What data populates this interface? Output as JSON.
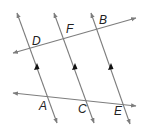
{
  "diagram": {
    "type": "geometry-parallel-lines",
    "colors": {
      "line": "#7d7d7d",
      "label": "#222222",
      "arrow": "#111111",
      "background": "#ffffff"
    },
    "transversals": [
      {
        "name": "top-line",
        "from": [
          13,
          53
        ],
        "to": [
          136,
          18
        ],
        "points": [
          "D",
          "F",
          "B"
        ]
      },
      {
        "name": "bottom-line",
        "from": [
          13,
          93
        ],
        "to": [
          136,
          106
        ],
        "points": [
          "A",
          "C",
          "E"
        ]
      }
    ],
    "parallel_lines": [
      {
        "name": "line-DA",
        "from": [
          17,
          13
        ],
        "to": [
          57,
          123
        ],
        "points": [
          "D",
          "A"
        ]
      },
      {
        "name": "line-FC",
        "from": [
          54,
          13
        ],
        "to": [
          94,
          123
        ],
        "points": [
          "F",
          "C"
        ]
      },
      {
        "name": "line-BE",
        "from": [
          91,
          13
        ],
        "to": [
          130,
          124
        ],
        "points": [
          "B",
          "E"
        ]
      }
    ],
    "labels": {
      "D": "D",
      "F": "F",
      "B": "B",
      "A": "A",
      "C": "C",
      "E": "E"
    }
  }
}
